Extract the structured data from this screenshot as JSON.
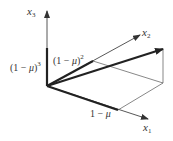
{
  "diagram": {
    "type": "3d-vector-decomposition",
    "axes": {
      "x1": {
        "label_base": "x",
        "label_sub": "1"
      },
      "x2": {
        "label_base": "x",
        "label_sub": "2"
      },
      "x3": {
        "label_base": "x",
        "label_sub": "3"
      }
    },
    "components": {
      "x1": {
        "label_text": "1 − ",
        "label_symbol": "μ",
        "label_power": ""
      },
      "x2": {
        "label_text": "(1 − ",
        "label_symbol": "μ",
        "label_close": ")",
        "label_power": "2"
      },
      "x3": {
        "label_text": "(1 − ",
        "label_symbol": "μ",
        "label_close": ")",
        "label_power": "3"
      }
    },
    "colors": {
      "line": "#444444",
      "thick": "#222222",
      "text": "#333333",
      "background": "#ffffff"
    }
  }
}
